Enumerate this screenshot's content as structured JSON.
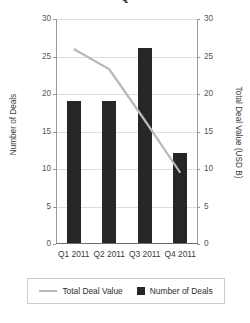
{
  "chart_data": {
    "type": "bar",
    "title": "Q",
    "categories": [
      "Q1 2011",
      "Q2 2011",
      "Q3 2011",
      "Q4 2011"
    ],
    "series": [
      {
        "name": "Number of Deals",
        "type": "bar",
        "axis": "left",
        "color": "#262626",
        "values": [
          19,
          19,
          26,
          12
        ]
      },
      {
        "name": "Total Deal Value",
        "type": "line",
        "axis": "right",
        "color": "#b9b9b9",
        "values": [
          26,
          23.3,
          16.5,
          9.5
        ]
      }
    ],
    "xlabel": "",
    "ylabel": "Number of Deals",
    "y2label": "Total Deal Value (USD B)",
    "ylim": [
      0,
      30
    ],
    "y2lim": [
      0,
      30
    ],
    "yticks": [
      0,
      5,
      10,
      15,
      20,
      25,
      30
    ],
    "y2ticks": [
      0,
      5,
      10,
      15,
      20,
      25,
      30
    ],
    "ytick_labels": [
      "0",
      "5",
      "10",
      "15",
      "20",
      "25",
      "30"
    ],
    "y2tick_labels": [
      "0",
      "5",
      "10",
      "15",
      "20",
      "25",
      "30"
    ],
    "grid": true,
    "grid_axis": "y",
    "legend": [
      "Total Deal Value",
      "Number of Deals"
    ],
    "legend_position": "bottom"
  },
  "legend": {
    "line_label": "Total Deal Value",
    "bar_label": "Number of Deals"
  },
  "axes": {
    "left_title": "Number of Deals",
    "right_title": "Total Deal Value (USD B)"
  }
}
